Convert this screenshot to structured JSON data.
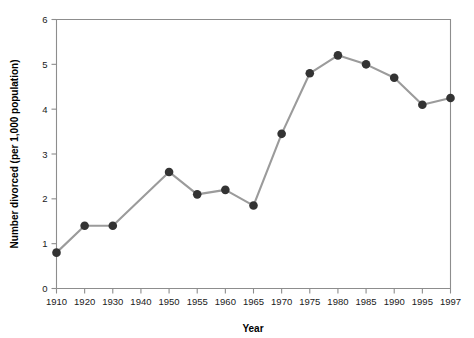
{
  "chart_data": {
    "type": "line",
    "title": "",
    "xlabel": "Year",
    "ylabel": "Number divorced (per 1,000 population)",
    "categories": [
      "1910",
      "1920",
      "1930",
      "1940",
      "1950",
      "1955",
      "1960",
      "1965",
      "1970",
      "1975",
      "1980",
      "1985",
      "1990",
      "1995",
      "1997"
    ],
    "values": [
      0.8,
      1.4,
      1.4,
      null,
      2.6,
      2.1,
      2.2,
      1.85,
      3.45,
      4.8,
      5.2,
      5.0,
      4.7,
      4.1,
      4.25
    ],
    "series": [
      {
        "name": "Number divorced (per 1,000 population)",
        "values": [
          0.8,
          1.4,
          1.4,
          null,
          2.6,
          2.1,
          2.2,
          1.85,
          3.45,
          4.8,
          5.2,
          5.0,
          4.7,
          4.1,
          4.25
        ]
      }
    ],
    "ylim": [
      0,
      6
    ],
    "yticks": [
      0,
      1,
      2,
      3,
      4,
      5,
      6
    ],
    "ytick_labels": [
      "0",
      "1",
      "2",
      "3",
      "4",
      "5",
      "6"
    ],
    "xtick_labels": [
      "1910",
      "1920",
      "1930",
      "1940",
      "1950",
      "1955",
      "1960",
      "1965",
      "1970",
      "1975",
      "1980",
      "1985",
      "1990",
      "1995",
      "1997"
    ],
    "grid": false,
    "legend": "none",
    "marker": "filled-circle",
    "colors": {
      "line": "#9b9b9b",
      "marker": "#333333",
      "axis": "#8d8d8d",
      "text": "#1a1a1a",
      "background": "#ffffff"
    }
  }
}
